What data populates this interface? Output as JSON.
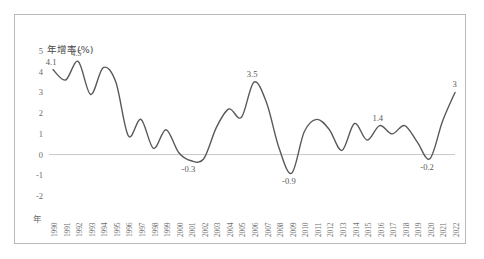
{
  "chart_data": {
    "type": "line",
    "title": "",
    "ylabel": "年增率(%)",
    "xlabel": "年",
    "ylim": [
      -2,
      5
    ],
    "yticks": [
      5,
      4,
      3,
      2,
      1,
      0,
      -1,
      -2
    ],
    "ytick_labels": [
      "5",
      "4",
      "3",
      "2",
      "1",
      "0",
      "-1",
      "-2"
    ],
    "grid": false,
    "zero_line": true,
    "legend": "none",
    "line_color": "#595959",
    "categories": [
      "1990",
      "1991",
      "1992",
      "1993",
      "1994",
      "1995",
      "1996",
      "1997",
      "1998",
      "1999",
      "2000",
      "2001",
      "2002",
      "2003",
      "2004",
      "2005",
      "2006",
      "2007",
      "2008",
      "2009",
      "2010",
      "2011",
      "2012",
      "2013",
      "2014",
      "2015",
      "2016",
      "2017",
      "2018",
      "2019",
      "2020",
      "2021",
      "2022"
    ],
    "values": [
      4.1,
      3.6,
      4.5,
      2.9,
      4.2,
      3.5,
      0.9,
      1.7,
      0.3,
      1.2,
      0.1,
      -0.3,
      -0.2,
      1.3,
      2.2,
      1.8,
      3.5,
      2.5,
      0.3,
      -0.9,
      1.1,
      1.7,
      1.2,
      0.2,
      1.5,
      0.7,
      1.4,
      1.0,
      1.4,
      0.6,
      -0.2,
      1.6,
      3.0
    ],
    "data_labels": [
      {
        "year": "1990",
        "value": "4.1"
      },
      {
        "year": "1992",
        "value": "4.5"
      },
      {
        "year": "2001",
        "value": "-0.3"
      },
      {
        "year": "2006",
        "value": "3.5"
      },
      {
        "year": "2009",
        "value": "-0.9"
      },
      {
        "year": "2016",
        "value": "1.4"
      },
      {
        "year": "2020",
        "value": "-0.2"
      },
      {
        "year": "2022",
        "value": "3"
      }
    ]
  }
}
